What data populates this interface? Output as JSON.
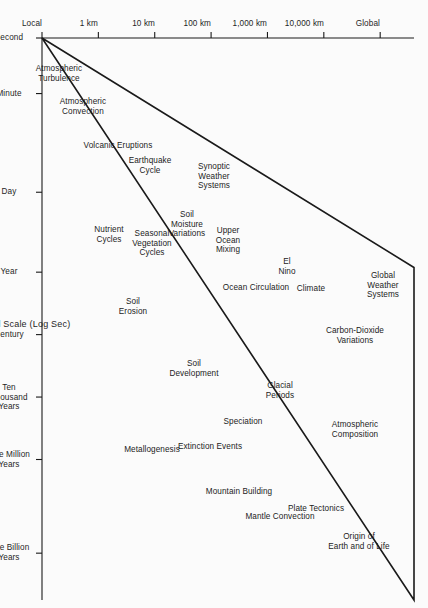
{
  "figure": {
    "background_color": "#fbfbfb",
    "line_color": "#1a1a1a",
    "text_color": "#1c1c1c"
  },
  "chart_data": {
    "type": "scatter",
    "title": "",
    "xlabel": "Characteristic Temporal Scale (Log Sec)",
    "ylabel": "Characteristic Spatial Scale",
    "grid": false,
    "legend": null,
    "xticklabels": [
      "Second",
      "Minute",
      "Day",
      "Year",
      "Century",
      "Ten\nThousand\nYears",
      "One Million\nYears",
      "One Billion\nYears"
    ],
    "xtick_positions": [
      0,
      1.78,
      4.94,
      7.5,
      9.5,
      11.5,
      13.5,
      16.5
    ],
    "xlim": [
      0,
      18
    ],
    "yticklabels": [
      "Local",
      "1 km",
      "10 km",
      "100 km",
      "1,000 km",
      "10,000 km",
      "Global"
    ],
    "ytick_positions": [
      0,
      1,
      2,
      3,
      4,
      5,
      6
    ],
    "ylim": [
      0,
      6.6
    ],
    "envelope": {
      "description": "Triangular wedge enclosing all phenomena",
      "vertices": [
        [
          0,
          0
        ],
        [
          18,
          6.6
        ],
        [
          7.35,
          6.6
        ]
      ]
    },
    "points": [
      {
        "label": "Atmospheric\nTurbulence",
        "x": 1.15,
        "y": 0.3
      },
      {
        "label": "Atmospheric\nConvection",
        "x": 2.2,
        "y": 0.72
      },
      {
        "label": "Volcanic Eruptions",
        "x": 3.45,
        "y": 1.35
      },
      {
        "label": "Earthquake\nCycle",
        "x": 4.1,
        "y": 1.92
      },
      {
        "label": "Nutrient\nCycles",
        "x": 6.3,
        "y": 1.18
      },
      {
        "label": "Seasonal\nVegetation\nCycles",
        "x": 6.6,
        "y": 1.95
      },
      {
        "label": "Soil\nErosion",
        "x": 8.6,
        "y": 1.62
      },
      {
        "label": "Soil\nMoisture\nVariations",
        "x": 6.0,
        "y": 2.58
      },
      {
        "label": "Synoptic\nWeather\nSystems",
        "x": 4.45,
        "y": 3.05
      },
      {
        "label": "Upper\nOcean\nMixing",
        "x": 6.5,
        "y": 3.3
      },
      {
        "label": "Soil\nDevelopment",
        "x": 10.6,
        "y": 2.7
      },
      {
        "label": "Metallogenesis",
        "x": 13.2,
        "y": 1.95
      },
      {
        "label": "Ocean Circulation",
        "x": 8.0,
        "y": 3.8
      },
      {
        "label": "El\nNino",
        "x": 7.35,
        "y": 4.35
      },
      {
        "label": "Climate",
        "x": 8.05,
        "y": 4.78
      },
      {
        "label": "Glacial\nPeriods",
        "x": 11.3,
        "y": 4.22
      },
      {
        "label": "Speciation",
        "x": 12.3,
        "y": 3.56
      },
      {
        "label": "Extinction Events",
        "x": 13.1,
        "y": 2.98
      },
      {
        "label": "Mountain Building",
        "x": 14.55,
        "y": 3.5
      },
      {
        "label": "Mantle Convection",
        "x": 15.35,
        "y": 4.22
      },
      {
        "label": "Plate Tectonics",
        "x": 15.1,
        "y": 4.86
      },
      {
        "label": "Carbon-Dioxide\nVariations",
        "x": 9.55,
        "y": 5.55
      },
      {
        "label": "Atmospheric\nComposition",
        "x": 12.55,
        "y": 5.55
      },
      {
        "label": "Origin of\nEarth and of Life",
        "x": 16.15,
        "y": 5.62
      },
      {
        "label": "Global\nWeather\nSystems",
        "x": 7.95,
        "y": 6.05
      }
    ]
  }
}
